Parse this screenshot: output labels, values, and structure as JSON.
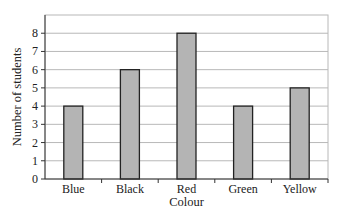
{
  "chart_data": {
    "type": "bar",
    "title": "",
    "xlabel": "Colour",
    "ylabel": "Number of students",
    "categories": [
      "Blue",
      "Black",
      "Red",
      "Green",
      "Yellow"
    ],
    "values": [
      4,
      6,
      8,
      4,
      5
    ],
    "ylim": [
      0,
      9
    ],
    "yticks": [
      0,
      1,
      2,
      3,
      4,
      5,
      6,
      7,
      8
    ],
    "grid": true,
    "legend": null,
    "bar_color": "#b4b4b4",
    "bar_edge_color": "#222222",
    "grid_color": "#b8b8b8"
  }
}
